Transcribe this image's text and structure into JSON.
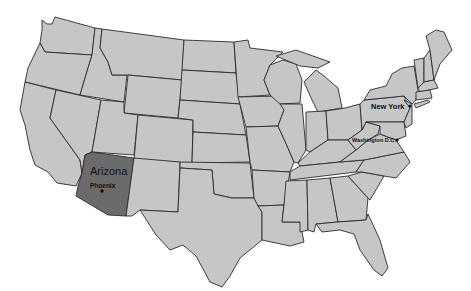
{
  "map": {
    "title": "United States",
    "colors": {
      "state_fill": "#c6c6c6",
      "highlight_fill": "#6b6b6b",
      "border": "#2b2b2b",
      "background": "#ffffff"
    },
    "highlighted_state": "Arizona",
    "labels": {
      "arizona": "Arizona",
      "phoenix": "Phoenix",
      "new_york": "New York",
      "washington_dc": "Washington D.C."
    },
    "markers": [
      {
        "name": "Phoenix",
        "type": "city-dot"
      },
      {
        "name": "New York",
        "type": "city-dot"
      },
      {
        "name": "Washington D.C.",
        "type": "capital-dot"
      }
    ]
  }
}
